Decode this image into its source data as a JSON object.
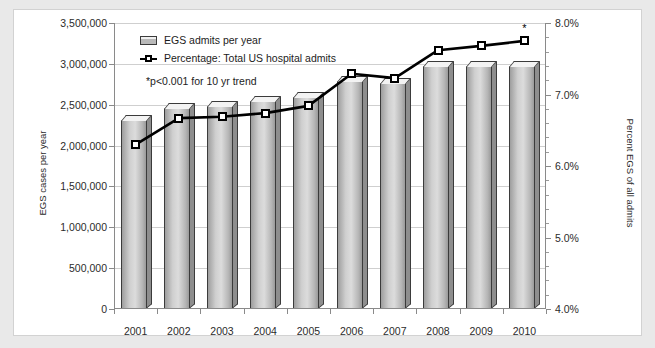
{
  "chart_data": {
    "type": "bar",
    "title": "",
    "categories": [
      "2001",
      "2002",
      "2003",
      "2004",
      "2005",
      "2006",
      "2007",
      "2008",
      "2009",
      "2010"
    ],
    "xlabel": "",
    "ylabel": "EGS cases per year",
    "y2label": "Percent EGS of all admits",
    "ylim": [
      0,
      3500000
    ],
    "y2lim": [
      4.0,
      8.0
    ],
    "ytick_labels": [
      "0",
      "500,000",
      "1,000,000",
      "1,500,000",
      "2,000,000",
      "2,500,000",
      "3,000,000",
      "3,500,000"
    ],
    "ytick_values": [
      0,
      500000,
      1000000,
      1500000,
      2000000,
      2500000,
      3000000,
      3500000
    ],
    "y2tick_labels": [
      "4.0%",
      "5.0%",
      "6.0%",
      "7.0%",
      "8.0%"
    ],
    "y2tick_values": [
      4.0,
      5.0,
      6.0,
      7.0,
      8.0
    ],
    "y2_minor_step": 0.2,
    "grid": true,
    "legend_position": "top-left",
    "annotation": "*p<0.001 for 10 yr trend",
    "annotation_marker": "*",
    "series": [
      {
        "name": "EGS admits per year",
        "type": "bar",
        "axis": "left",
        "values": [
          2380000,
          2520000,
          2540000,
          2610000,
          2660000,
          2850000,
          2830000,
          3030000,
          3030000,
          3040000
        ]
      },
      {
        "name": "Percentage: Total US hospital admits",
        "type": "line",
        "axis": "right",
        "values": [
          6.3,
          6.67,
          6.69,
          6.74,
          6.84,
          7.29,
          7.23,
          7.62,
          7.68,
          7.75
        ]
      }
    ]
  },
  "legend": {
    "items": [
      {
        "label": "EGS admits per year",
        "marker": "bar-swatch"
      },
      {
        "label": "Percentage: Total US hospital admits",
        "marker": "line-square-swatch"
      }
    ]
  },
  "colors": {
    "bar_fill": "#cfcfcf",
    "bar_outline": "#3b3b3b",
    "line": "#000000",
    "marker_fill": "#ffffff",
    "grid": "#cfcfcf",
    "axis": "#8a8a8a",
    "page_background": "#e9e9e9",
    "figure_background": "#ffffff"
  }
}
